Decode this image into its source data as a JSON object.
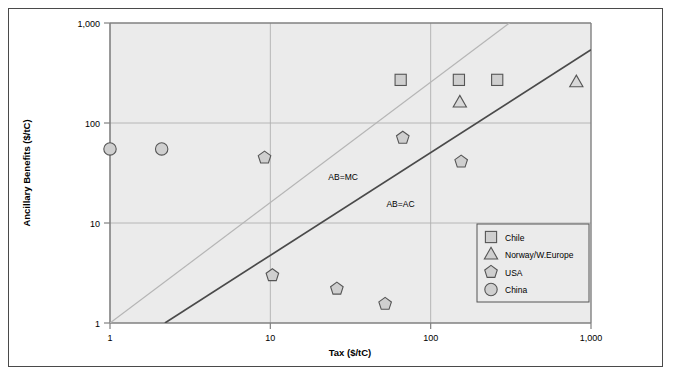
{
  "chart_data": {
    "type": "scatter",
    "title": "",
    "xlabel": "Tax ($/tC)",
    "ylabel": "Ancillary Benefits ($/tC)",
    "xscale": "log",
    "yscale": "log",
    "xlim": [
      1,
      1000
    ],
    "ylim": [
      1,
      1000
    ],
    "xticks": [
      "1",
      "10",
      "100",
      "1,000"
    ],
    "xtick_values": [
      1,
      10,
      100,
      1000
    ],
    "yticks": [
      "1",
      "10",
      "100",
      "1,000"
    ],
    "ytick_values": [
      1,
      10,
      100,
      1000
    ],
    "grid": true,
    "legend_position": "bottom-right",
    "series": [
      {
        "name": "Chile",
        "marker": "square",
        "color": "#cfcfcf",
        "edge": "#555555",
        "points": [
          {
            "x": 65,
            "y": 270
          },
          {
            "x": 150,
            "y": 270
          },
          {
            "x": 260,
            "y": 270
          }
        ]
      },
      {
        "name": "Norway/W.Europe",
        "marker": "triangle",
        "color": "#d8d8d8",
        "edge": "#555555",
        "points": [
          {
            "x": 152,
            "y": 160
          },
          {
            "x": 810,
            "y": 255
          }
        ]
      },
      {
        "name": "USA",
        "marker": "pentagon",
        "color": "#cfcfcf",
        "edge": "#555555",
        "points": [
          {
            "x": 9.2,
            "y": 45
          },
          {
            "x": 67,
            "y": 71
          },
          {
            "x": 155,
            "y": 41
          },
          {
            "x": 10.3,
            "y": 3.0
          },
          {
            "x": 26,
            "y": 2.2
          },
          {
            "x": 52,
            "y": 1.55
          }
        ]
      },
      {
        "name": "China",
        "marker": "circle",
        "color": "#cfcfcf",
        "edge": "#555555",
        "points": [
          {
            "x": 1.0,
            "y": 55
          },
          {
            "x": 2.1,
            "y": 55
          }
        ]
      }
    ],
    "reference_lines": [
      {
        "label": "AB=MC",
        "color": "#b5b5b5",
        "from": {
          "x": 1,
          "y": 1
        },
        "to": {
          "x": 310,
          "y": 1000
        }
      },
      {
        "label": "AB=AC",
        "color": "#4a4a4a",
        "from": {
          "x": 2.2,
          "y": 1
        },
        "to": {
          "x": 1000,
          "y": 540
        }
      }
    ],
    "annotations": [
      {
        "text": "AB=MC",
        "x": 23,
        "y": 27
      },
      {
        "text": "AB=AC",
        "x": 53,
        "y": 14.5
      }
    ]
  },
  "legend": {
    "items": [
      {
        "label": "Chile",
        "marker": "square"
      },
      {
        "label": "Norway/W.Europe",
        "marker": "triangle"
      },
      {
        "label": "USA",
        "marker": "pentagon"
      },
      {
        "label": "China",
        "marker": "circle"
      }
    ]
  },
  "colors": {
    "plot_background": "#ebebeb",
    "grid": "#b0b0b0",
    "axis": "#808080",
    "marker_fill": "#cfcfcf",
    "marker_edge": "#555555",
    "line_ab_mc": "#b5b5b5",
    "line_ab_ac": "#4a4a4a",
    "frame": "#4a4a4a"
  }
}
